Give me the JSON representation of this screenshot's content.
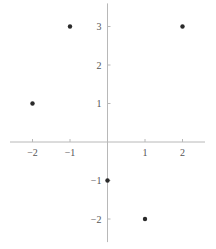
{
  "chart_data": {
    "type": "scatter",
    "title": "",
    "xlabel": "",
    "ylabel": "",
    "xlim": [
      -2.6,
      2.6
    ],
    "ylim": [
      -2.6,
      3.6
    ],
    "grid": false,
    "legend": null,
    "axes_style": "centered at origin",
    "x_ticks": [
      -2,
      -1,
      1,
      2
    ],
    "x_tick_labels": [
      "−2",
      "−1",
      "1",
      "2"
    ],
    "y_ticks": [
      -2,
      -1,
      1,
      2,
      3
    ],
    "y_tick_labels": [
      "−2",
      "−1",
      "1",
      "2",
      "3"
    ],
    "series": [
      {
        "name": "points",
        "color": "#2a2a2a",
        "points": [
          {
            "x": -2,
            "y": 1
          },
          {
            "x": -1,
            "y": 3
          },
          {
            "x": 2,
            "y": 3
          },
          {
            "x": 0,
            "y": -1
          },
          {
            "x": 1,
            "y": -2
          }
        ]
      }
    ]
  },
  "layout": {
    "origin_px": [
      107.5,
      142
    ],
    "x_unit_px": 37.5,
    "y_unit_px": 38.5
  }
}
